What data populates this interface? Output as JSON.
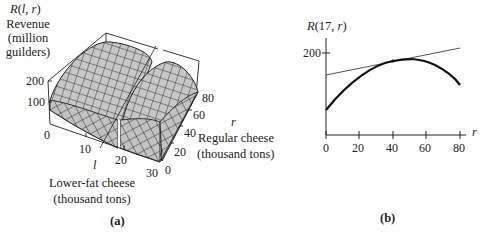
{
  "figure_a": {
    "panel_label": "(a)",
    "z_axis": {
      "function_label": "R(l, r)",
      "title_lines": [
        "Revenue",
        "(million",
        "guilders)"
      ],
      "ticks": [
        "0",
        "100",
        "200"
      ]
    },
    "l_axis": {
      "symbol": "l",
      "title_lines": [
        "Lower-fat cheese",
        "(thousand tons)"
      ],
      "ticks": [
        "10",
        "20",
        "30"
      ]
    },
    "r_axis": {
      "symbol": "r",
      "title_lines": [
        "Regular cheese",
        "(thousand tons)"
      ],
      "ticks": [
        "0",
        "20",
        "40",
        "60",
        "80"
      ]
    },
    "surface_color": "#c8c8c8",
    "mesh_color": "#222222"
  },
  "figure_b": {
    "panel_label": "(b)",
    "y_label": "R(17, r)",
    "x_label": "r",
    "y_ticks": [
      "200"
    ],
    "x_ticks": [
      "0",
      "20",
      "40",
      "60",
      "80"
    ]
  },
  "chart_data": [
    {
      "type": "surface",
      "title": "R(l, r) Revenue (million guilders)",
      "xlabel": "l  Lower-fat cheese (thousand tons)",
      "ylabel": "r  Regular cheese (thousand tons)",
      "zlabel": "R(l, r) Revenue (million guilders)",
      "x_ticks": [
        0,
        10,
        20,
        30
      ],
      "y_ticks": [
        0,
        20,
        40,
        60,
        80
      ],
      "z_ticks": [
        0,
        100,
        200
      ],
      "xlim": [
        0,
        30
      ],
      "ylim": [
        0,
        80
      ],
      "zlim": [
        0,
        200
      ],
      "annotations": [
        "surface cut by the plane l = 17"
      ]
    },
    {
      "type": "line",
      "title": "R(17, r)",
      "xlabel": "r",
      "ylabel": "R(17, r)",
      "x_ticks": [
        0,
        20,
        40,
        60,
        80
      ],
      "y_ticks": [
        200
      ],
      "xlim": [
        0,
        80
      ],
      "series": [
        {
          "name": "R(17, r)",
          "x": [
            0,
            10,
            20,
            30,
            40,
            50,
            60,
            70,
            80
          ],
          "values": [
            61,
            103,
            137,
            163,
            180,
            185,
            178,
            158,
            122
          ]
        },
        {
          "name": "tangent line at r = 40",
          "x": [
            0,
            80
          ],
          "values": [
            146,
            212
          ]
        }
      ],
      "annotations": [
        "tangent point at r = 40, R ≈ 180"
      ],
      "grid": false
    }
  ]
}
